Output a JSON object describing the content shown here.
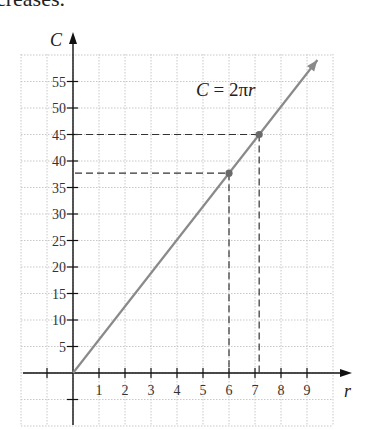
{
  "header_text": "creases.",
  "chart_data": {
    "type": "line",
    "title": "",
    "xlabel": "r",
    "ylabel": "C",
    "equation_label": "C = 2πr",
    "xlim": [
      -2,
      10
    ],
    "ylim": [
      -10,
      60
    ],
    "x_ticks": [
      1,
      2,
      3,
      4,
      5,
      6,
      7,
      8,
      9
    ],
    "x_tick_labels": [
      "1",
      "2",
      "3",
      "4",
      "5",
      "6",
      "7",
      "8",
      "9"
    ],
    "y_ticks": [
      5,
      10,
      15,
      20,
      25,
      30,
      35,
      40,
      45,
      50,
      55
    ],
    "y_tick_labels": [
      "5",
      "10",
      "15",
      "20",
      "25",
      "30",
      "35",
      "40",
      "45",
      "50",
      "55"
    ],
    "extra_ticks": {
      "x": [
        -1
      ],
      "y": [
        -5
      ]
    },
    "grid": true,
    "grid_x_step": 1,
    "grid_y_step": 5,
    "series": [
      {
        "name": "C = 2πr",
        "slope": 6.2832,
        "x": [
          0,
          9.4
        ],
        "y": [
          0,
          59.06
        ],
        "color": "#8a8a8a"
      }
    ],
    "highlighted_points": [
      {
        "x": 6,
        "y": 37.7,
        "color": "#6a6a6a"
      },
      {
        "x": 7.16,
        "y": 45,
        "color": "#6a6a6a"
      }
    ]
  }
}
